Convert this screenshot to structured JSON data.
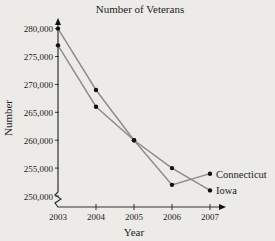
{
  "chart_data": {
    "type": "line",
    "title": "Number of Veterans",
    "xlabel": "Year",
    "ylabel": "Number",
    "categories": [
      "2003",
      "2004",
      "2005",
      "2006",
      "2007"
    ],
    "y_ticks": [
      "250,000",
      "255,000",
      "260,000",
      "265,000",
      "270,000",
      "275,000",
      "280,000"
    ],
    "ylim": [
      250000,
      280000
    ],
    "y_axis_break": true,
    "grid": false,
    "legend_position": "inline-right-end",
    "series": [
      {
        "name": "Connecticut",
        "values": [
          280000,
          269000,
          260000,
          252000,
          254000
        ]
      },
      {
        "name": "Iowa",
        "values": [
          277000,
          266000,
          260000,
          255000,
          251000
        ]
      }
    ]
  },
  "colors": {
    "line": "#8a8a8a",
    "marker": "#111111",
    "axis": "#333333",
    "background": "#ecebe8"
  }
}
